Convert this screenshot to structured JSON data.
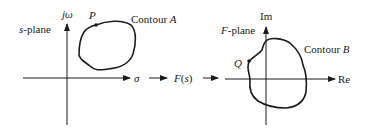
{
  "left_plane": {
    "plane_label_var": "s",
    "plane_label_rest": "-plane",
    "vertical_axis_label": "jω",
    "horizontal_axis_label": "σ",
    "contour_label": "Contour ",
    "contour_letter": "A",
    "point_label": "P"
  },
  "mapping": {
    "function_label": "F(s)"
  },
  "right_plane": {
    "plane_label_var": "F",
    "plane_label_rest": "-plane",
    "vertical_axis_label": "Im",
    "horizontal_axis_label": "Re",
    "contour_label": "Contour ",
    "contour_letter": "B",
    "point_label": "Q"
  },
  "colors": {
    "ink": "#1a1a1a",
    "background": "#ffffff"
  }
}
